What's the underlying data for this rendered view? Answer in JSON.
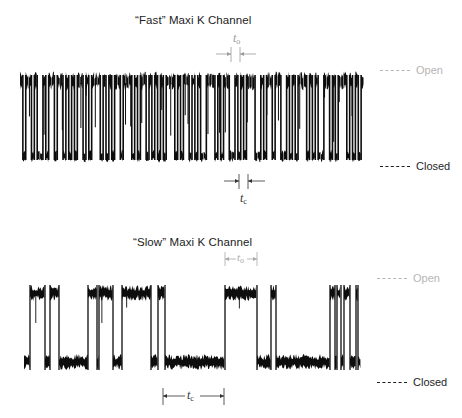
{
  "colors": {
    "trace": "#0d0d0d",
    "open_label": "#b5b5b5",
    "closed_label": "#1e1e1e",
    "fast_to_marker": "#9a9a9a",
    "slow_to_marker": "#a8a8a8",
    "tc_marker": "#333333"
  },
  "panels": [
    {
      "id": "fast",
      "title": "“Fast” Maxi K Channel",
      "legend": {
        "open": "Open",
        "closed": "Closed"
      },
      "markers": {
        "open_time": {
          "symbol": "t",
          "subscript": "o"
        },
        "closed_time": {
          "symbol": "t",
          "subscript": "c"
        }
      },
      "trace": {
        "x_start": 20,
        "x_end": 364,
        "open_y": 75,
        "closed_y": 160,
        "states": "OCOOCOCCOCOOCOOCOCOCOOCOCOOOCOCOCOOCOOOCOCOOCOCOCOCOOOCOCOOCOCOCCOOOCOCOOCCOCOCOOOCCOCOOCOOCCOCOCOOOCOCOCCOOCOCOOOCOCOCO"
      }
    },
    {
      "id": "slow",
      "title": "“Slow” Maxi K Channel",
      "legend": {
        "open": "Open",
        "closed": "Closed"
      },
      "markers": {
        "open_time": {
          "symbol": "t",
          "subscript": "o"
        },
        "closed_time": {
          "symbol": "t",
          "subscript": "c"
        }
      },
      "trace": {
        "x_start": 24,
        "x_end": 361,
        "open_y": 285,
        "closed_y": 370,
        "segments": [
          [
            "C",
            24,
            30
          ],
          [
            "O",
            30,
            45
          ],
          [
            "C",
            45,
            50
          ],
          [
            "O",
            50,
            59
          ],
          [
            "C",
            59,
            88
          ],
          [
            "O",
            88,
            97
          ],
          [
            "C",
            97,
            99
          ],
          [
            "O",
            99,
            113
          ],
          [
            "C",
            113,
            122
          ],
          [
            "O",
            122,
            151
          ],
          [
            "C",
            151,
            158
          ],
          [
            "O",
            158,
            165
          ],
          [
            "C",
            165,
            225
          ],
          [
            "O",
            225,
            257
          ],
          [
            "C",
            257,
            271
          ],
          [
            "O",
            271,
            276
          ],
          [
            "C",
            276,
            330
          ],
          [
            "O",
            330,
            335
          ],
          [
            "C",
            335,
            337
          ],
          [
            "O",
            337,
            341
          ],
          [
            "C",
            341,
            344
          ],
          [
            "O",
            344,
            350
          ],
          [
            "C",
            350,
            356
          ],
          [
            "O",
            356,
            358
          ],
          [
            "C",
            358,
            361
          ]
        ]
      }
    }
  ]
}
